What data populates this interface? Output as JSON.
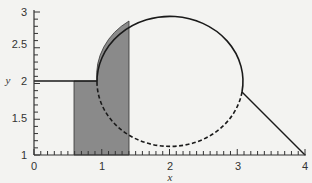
{
  "chart_data": {
    "type": "line",
    "title": "",
    "xlabel": "x",
    "ylabel": "y",
    "xlim": [
      0,
      4
    ],
    "ylim": [
      1,
      3
    ],
    "x_ticks": [
      "0",
      "1",
      "2",
      "3",
      "4"
    ],
    "y_ticks": [
      "1",
      "1.5",
      "2",
      "2.5",
      "3"
    ],
    "grid": false,
    "legend": null,
    "elements": [
      {
        "name": "horizontal segment",
        "style": "solid",
        "points": [
          [
            0,
            2
          ],
          [
            0.93,
            2
          ]
        ]
      },
      {
        "name": "circle",
        "center": [
          2,
          1.96
        ],
        "radius_x": 1.07,
        "radius_y": 0.9,
        "upper_arc": "solid",
        "lower_arc": "dashed"
      },
      {
        "name": "diagonal segment",
        "style": "solid",
        "points": [
          [
            3.05,
            1.85
          ],
          [
            4,
            1
          ]
        ]
      },
      {
        "name": "shaded region",
        "fill": "#8a8a8a",
        "x_range": [
          0.6,
          1.4
        ],
        "top_boundary": "y=2 for x<0.93, then circle arc"
      }
    ]
  },
  "colors": {
    "background": "#f3f3f1",
    "line": "#1a1a1a",
    "shade": "#8a8a8a"
  }
}
